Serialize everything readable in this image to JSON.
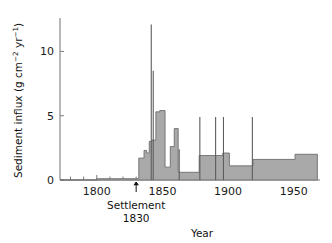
{
  "chart_data": {
    "type": "area",
    "title": "",
    "xlabel": "Year",
    "ylabel": "Sediment influx (g cm-2 yr-1)",
    "ylabel_parts": {
      "main": "Sediment influx (g cm",
      "sup1": "−2",
      "mid": " yr",
      "sup2": "−1",
      "tail": ")"
    },
    "xlim": [
      1772,
      1970
    ],
    "ylim": [
      0,
      12.6
    ],
    "grid": false,
    "legend": null,
    "y_ticks": [
      0,
      5,
      10
    ],
    "y_ticklabels": [
      "0",
      "5",
      "10"
    ],
    "x_ticks": [
      1800,
      1850,
      1900,
      1950
    ],
    "x_ticklabels": [
      "1800",
      "1850",
      "1900",
      "1950"
    ],
    "x_minor_tick_spacing": 10,
    "series_name": "Sediment influx",
    "fill_color": "#a9a9a9",
    "line_color": "#6d6d6d",
    "steps": [
      {
        "x0": 1772,
        "x1": 1800,
        "y": 0.0
      },
      {
        "x0": 1800,
        "x1": 1832,
        "y": 0.1
      },
      {
        "x0": 1832,
        "x1": 1836,
        "y": 1.7
      },
      {
        "x0": 1836,
        "x1": 1838,
        "y": 2.3
      },
      {
        "x0": 1838,
        "x1": 1840,
        "y": 2.1
      },
      {
        "x0": 1840,
        "x1": 1842,
        "y": 3.0
      },
      {
        "x0": 1842,
        "x1": 1845,
        "y": 3.1
      },
      {
        "x0": 1845,
        "x1": 1848,
        "y": 5.3
      },
      {
        "x0": 1848,
        "x1": 1852,
        "y": 5.4
      },
      {
        "x0": 1852,
        "x1": 1856,
        "y": 1.0
      },
      {
        "x0": 1856,
        "x1": 1859,
        "y": 2.6
      },
      {
        "x0": 1859,
        "x1": 1862,
        "y": 4.0
      },
      {
        "x0": 1862,
        "x1": 1864,
        "y": 0.6
      },
      {
        "x0": 1864,
        "x1": 1878,
        "y": 0.6
      },
      {
        "x0": 1878,
        "x1": 1896,
        "y": 1.9
      },
      {
        "x0": 1896,
        "x1": 1901,
        "y": 2.1
      },
      {
        "x0": 1901,
        "x1": 1919,
        "y": 1.1
      },
      {
        "x0": 1919,
        "x1": 1951,
        "y": 1.6
      },
      {
        "x0": 1951,
        "x1": 1968,
        "y": 2.0
      }
    ],
    "spikes": [
      {
        "x": 1841.5,
        "y": 12.1
      },
      {
        "x": 1843.0,
        "y": 8.5
      },
      {
        "x": 1862.8,
        "y": 2.4
      },
      {
        "x": 1878.5,
        "y": 4.9
      },
      {
        "x": 1890.5,
        "y": 4.9
      },
      {
        "x": 1896.5,
        "y": 4.9
      },
      {
        "x": 1918.5,
        "y": 4.9
      }
    ],
    "annotations": [
      {
        "name": "settlement-marker",
        "x": 1830,
        "label_line1": "Settlement",
        "label_line2": "1830",
        "marker": "up-arrow"
      }
    ]
  }
}
